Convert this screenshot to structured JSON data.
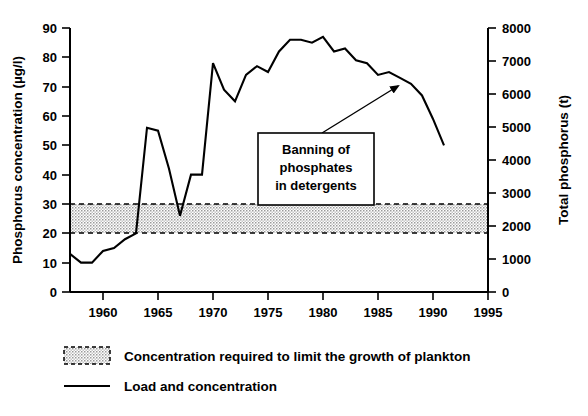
{
  "chart_data": {
    "type": "line",
    "title": "",
    "xlabel": "",
    "ylabel": "Phosphorus concentration (µg/l)",
    "y2label": "Total phosphorus (t)",
    "xlim": [
      1957,
      1995
    ],
    "ylim": [
      0,
      90
    ],
    "y2lim": [
      0,
      8000
    ],
    "grid": false,
    "xticks": [
      1960,
      1965,
      1970,
      1975,
      1980,
      1985,
      1990,
      1995
    ],
    "xticklabels": [
      "1960",
      "1965",
      "1970",
      "1975",
      "1980",
      "1985",
      "1990",
      "1995"
    ],
    "yticks": [
      0,
      10,
      20,
      30,
      40,
      50,
      60,
      70,
      80,
      90
    ],
    "yticklabels": [
      "0",
      "10",
      "20",
      "30",
      "40",
      "50",
      "60",
      "70",
      "80",
      "90"
    ],
    "y2ticks": [
      0,
      1000,
      2000,
      3000,
      4000,
      5000,
      6000,
      7000,
      8000
    ],
    "y2ticklabels": [
      "0",
      "1000",
      "2000",
      "3000",
      "4000",
      "5000",
      "6000",
      "7000",
      "8000"
    ],
    "legend_position": "below-plot",
    "series": [
      {
        "name": "Load and concentration",
        "style": "solid-line",
        "x": [
          1957,
          1958,
          1959,
          1960,
          1961,
          1962,
          1963,
          1964,
          1965,
          1966,
          1967,
          1968,
          1969,
          1970,
          1971,
          1972,
          1973,
          1974,
          1975,
          1976,
          1977,
          1978,
          1979,
          1980,
          1981,
          1982,
          1983,
          1984,
          1985,
          1986,
          1987,
          1988,
          1989,
          1990,
          1991
        ],
        "values": [
          13,
          10,
          10,
          14,
          15,
          18,
          20,
          56,
          55,
          42,
          26,
          40,
          40,
          78,
          69,
          65,
          74,
          77,
          75,
          82,
          86,
          86,
          85,
          87,
          82,
          83,
          79,
          78,
          74,
          75,
          73,
          71,
          67,
          59,
          50
        ]
      }
    ],
    "shaded_band": {
      "label": "Concentration required to limit the growth of plankton",
      "ymin": 20,
      "ymax": 30,
      "fill": "#d6d6d6",
      "border": "dashed"
    },
    "annotations": [
      {
        "text_lines": [
          "Banning of",
          "phosphates",
          "in detergents"
        ],
        "points_to_year": 1986,
        "points_to_value": 75,
        "arrow": true
      }
    ]
  },
  "legend": {
    "items": [
      {
        "marker": "dashed-box-swatch",
        "label": "Concentration required to limit the growth of plankton"
      },
      {
        "marker": "solid-line-swatch",
        "label": "Load and concentration"
      }
    ]
  },
  "colors": {
    "line": "#000000",
    "band_fill": "#d6d6d6",
    "background": "#ffffff",
    "text": "#000000"
  }
}
